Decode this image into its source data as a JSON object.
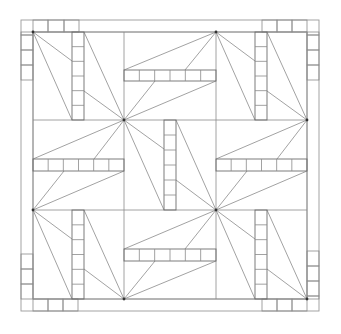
{
  "diagram": {
    "title": "",
    "colors": {
      "background": "#ffffff",
      "line": "#8a8a8a",
      "bar": "#6e6e6e",
      "hub": "#333333"
    },
    "outer_frame": {
      "x": 21,
      "y": 20,
      "w": 298,
      "h": 291
    },
    "inner_frame": {
      "x": 33,
      "y": 32,
      "w": 274,
      "h": 267
    },
    "grid": {
      "xs": [
        33,
        124,
        216,
        307
      ],
      "ys": [
        32,
        120,
        210,
        299
      ]
    },
    "hubs": [
      {
        "x": 33,
        "y": 32
      },
      {
        "x": 124,
        "y": 120
      },
      {
        "x": 216,
        "y": 32
      },
      {
        "x": 307,
        "y": 120
      },
      {
        "x": 216,
        "y": 210
      },
      {
        "x": 33,
        "y": 210
      },
      {
        "x": 124,
        "y": 299
      },
      {
        "x": 307,
        "y": 299
      }
    ],
    "bars": [
      {
        "cell": "top-left",
        "orient": "v",
        "x": 72,
        "y": 32,
        "w": 12,
        "h": 88,
        "segments": 6
      },
      {
        "cell": "top-middle",
        "orient": "h",
        "x": 124,
        "y": 70,
        "w": 92,
        "h": 11,
        "segments": 6
      },
      {
        "cell": "top-right",
        "orient": "v",
        "x": 255,
        "y": 32,
        "w": 12,
        "h": 88,
        "segments": 6
      },
      {
        "cell": "middle-left",
        "orient": "h",
        "x": 33,
        "y": 159,
        "w": 91,
        "h": 12,
        "segments": 6
      },
      {
        "cell": "center",
        "orient": "v",
        "x": 164,
        "y": 120,
        "w": 12,
        "h": 90,
        "segments": 6
      },
      {
        "cell": "middle-right",
        "orient": "h",
        "x": 216,
        "y": 159,
        "w": 91,
        "h": 12,
        "segments": 6
      },
      {
        "cell": "bottom-left",
        "orient": "v",
        "x": 72,
        "y": 210,
        "w": 12,
        "h": 89,
        "segments": 6
      },
      {
        "cell": "bottom-middle",
        "orient": "h",
        "x": 124,
        "y": 249,
        "w": 92,
        "h": 12,
        "segments": 6
      },
      {
        "cell": "bottom-right",
        "orient": "v",
        "x": 255,
        "y": 210,
        "w": 12,
        "h": 89,
        "segments": 6
      }
    ],
    "rays": [
      [
        33,
        32,
        72,
        61
      ],
      [
        33,
        32,
        72,
        120
      ],
      [
        124,
        120,
        84,
        32
      ],
      [
        124,
        120,
        84,
        91
      ],
      [
        216,
        32,
        124,
        70
      ],
      [
        216,
        32,
        185,
        70
      ],
      [
        124,
        120,
        155,
        81
      ],
      [
        124,
        120,
        216,
        81
      ],
      [
        216,
        32,
        255,
        61
      ],
      [
        216,
        32,
        255,
        120
      ],
      [
        307,
        120,
        267,
        32
      ],
      [
        307,
        120,
        267,
        91
      ],
      [
        124,
        120,
        33,
        159
      ],
      [
        124,
        120,
        94,
        159
      ],
      [
        33,
        210,
        64,
        171
      ],
      [
        33,
        210,
        124,
        171
      ],
      [
        124,
        120,
        164,
        149
      ],
      [
        124,
        120,
        164,
        210
      ],
      [
        216,
        210,
        176,
        120
      ],
      [
        216,
        210,
        176,
        180
      ],
      [
        307,
        120,
        216,
        159
      ],
      [
        307,
        120,
        277,
        159
      ],
      [
        216,
        210,
        247,
        171
      ],
      [
        216,
        210,
        307,
        171
      ],
      [
        33,
        210,
        72,
        239
      ],
      [
        33,
        210,
        72,
        299
      ],
      [
        124,
        299,
        84,
        210
      ],
      [
        124,
        299,
        84,
        269
      ],
      [
        216,
        210,
        124,
        249
      ],
      [
        216,
        210,
        185,
        249
      ],
      [
        124,
        299,
        155,
        261
      ],
      [
        124,
        299,
        216,
        261
      ],
      [
        216,
        210,
        255,
        239
      ],
      [
        216,
        210,
        255,
        299
      ],
      [
        307,
        299,
        267,
        210
      ],
      [
        307,
        299,
        267,
        269
      ]
    ],
    "border_squares": {
      "top": [
        [
          33,
          48
        ],
        [
          48,
          64
        ],
        [
          64,
          79
        ],
        [
          262,
          277
        ],
        [
          277,
          292
        ],
        [
          292,
          307
        ]
      ],
      "bottom": [
        [
          33,
          48
        ],
        [
          48,
          63
        ],
        [
          63,
          78
        ],
        [
          262,
          277
        ],
        [
          277,
          292
        ],
        [
          292,
          307
        ]
      ],
      "left": [
        [
          32,
          35
        ],
        [
          35,
          50
        ],
        [
          50,
          65
        ],
        [
          65,
          80
        ],
        [
          254,
          269
        ],
        [
          269,
          284
        ],
        [
          284,
          299
        ]
      ],
      "right": [
        [
          32,
          35
        ],
        [
          35,
          50
        ],
        [
          50,
          65
        ],
        [
          65,
          80
        ],
        [
          251,
          266
        ],
        [
          266,
          281
        ],
        [
          281,
          296
        ],
        [
          296,
          299
        ]
      ]
    }
  }
}
